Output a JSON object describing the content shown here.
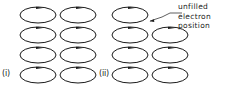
{
  "figure": {
    "type": "physics-orbit-diagram",
    "width": 235,
    "height": 89,
    "background_color": "#ffffff",
    "stroke_color": "#1a1a1a",
    "panels": [
      {
        "id": "i",
        "label": "(i)",
        "columns": 2,
        "rows": 4,
        "orbit_count": 8,
        "empty_positions": [],
        "orbits": [
          {
            "row": 0,
            "col": 0,
            "filled": true,
            "arrow_direction": "right"
          },
          {
            "row": 0,
            "col": 1,
            "filled": true,
            "arrow_direction": "right"
          },
          {
            "row": 1,
            "col": 0,
            "filled": true,
            "arrow_direction": "right"
          },
          {
            "row": 1,
            "col": 1,
            "filled": true,
            "arrow_direction": "right"
          },
          {
            "row": 2,
            "col": 0,
            "filled": true,
            "arrow_direction": "right"
          },
          {
            "row": 2,
            "col": 1,
            "filled": true,
            "arrow_direction": "right"
          },
          {
            "row": 3,
            "col": 0,
            "filled": true,
            "arrow_direction": "right"
          },
          {
            "row": 3,
            "col": 1,
            "filled": true,
            "arrow_direction": "right"
          }
        ]
      },
      {
        "id": "ii",
        "label": "(ii)",
        "columns": 2,
        "rows": 4,
        "orbit_count": 7,
        "empty_positions": [
          {
            "row": 0,
            "col": 1
          }
        ],
        "orbits": [
          {
            "row": 0,
            "col": 0,
            "filled": true,
            "arrow_direction": "right"
          },
          {
            "row": 0,
            "col": 1,
            "filled": false,
            "arrow_direction": ""
          },
          {
            "row": 1,
            "col": 0,
            "filled": true,
            "arrow_direction": "right"
          },
          {
            "row": 1,
            "col": 1,
            "filled": true,
            "arrow_direction": "right"
          },
          {
            "row": 2,
            "col": 0,
            "filled": true,
            "arrow_direction": "right"
          },
          {
            "row": 2,
            "col": 1,
            "filled": true,
            "arrow_direction": "right"
          },
          {
            "row": 3,
            "col": 0,
            "filled": true,
            "arrow_direction": "right"
          },
          {
            "row": 3,
            "col": 1,
            "filled": true,
            "arrow_direction": "right"
          }
        ]
      }
    ],
    "annotation": {
      "line1": "unfilled",
      "line2": "electron",
      "line3": "position",
      "leader_line": true,
      "points_to": "panel ii, row 0, col 1"
    }
  }
}
